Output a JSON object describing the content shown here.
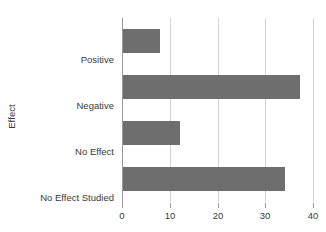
{
  "chart_data": {
    "type": "bar",
    "orientation": "horizontal",
    "title": "",
    "xlabel": "",
    "ylabel": "Effect",
    "categories": [
      "Positive",
      "Negative",
      "No Effect",
      "No Effect Studied"
    ],
    "values": [
      8,
      37,
      12,
      34
    ],
    "series": [
      {
        "name": "Count",
        "values": [
          8,
          37,
          12,
          34
        ]
      }
    ],
    "xlim": [
      0,
      40
    ],
    "xticks": [
      0,
      10,
      20,
      30,
      40
    ],
    "xtick_labels": [
      "0",
      "10",
      "20",
      "30",
      "40"
    ],
    "grid": "vertical",
    "legend": "none",
    "bar_color": "#6e6e6e",
    "gridline_color": "#d4d4d4",
    "axis_color": "#9a9a9a",
    "text_color": "#3a3a3a",
    "background_color": "#ffffff"
  }
}
